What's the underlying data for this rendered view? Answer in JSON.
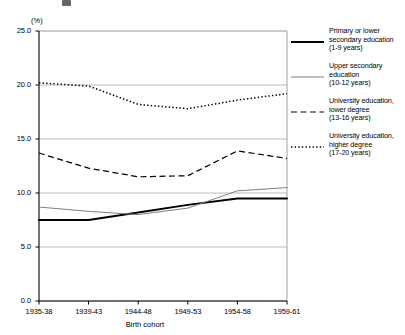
{
  "axes": {
    "unit_label": "(%)",
    "xlabel": "Birth cohort",
    "ylabel": "",
    "yticks": [
      "0.0",
      "5.0",
      "10.0",
      "15.0",
      "20.0",
      "25.0"
    ],
    "xticks": [
      "1935-38",
      "1939-43",
      "1944-48",
      "1949-53",
      "1954-58",
      "1959-61"
    ]
  },
  "legend": {
    "items": [
      {
        "label": "Primary or lower\nsecondary education\n(1-9 years)",
        "style": "solid-thick",
        "color": "#000000",
        "name": "primary-or-lower-secondary"
      },
      {
        "label": "Upper secondary\neducation\n(10-12 years)",
        "style": "solid-thin",
        "color": "#808080",
        "name": "upper-secondary"
      },
      {
        "label": "University education,\nlower degree\n(13-16 years)",
        "style": "dashed",
        "color": "#000000",
        "name": "university-lower-degree"
      },
      {
        "label": "University education,\nhigher degree\n(17-20 years)",
        "style": "dotted",
        "color": "#000000",
        "name": "university-higher-degree"
      }
    ]
  },
  "chart_data": {
    "type": "line",
    "title": "",
    "xlabel": "Birth cohort",
    "ylabel": "(%)",
    "ylim": [
      0.0,
      25.0
    ],
    "ytick_step": 5.0,
    "grid": true,
    "legend_position": "right",
    "categories": [
      "1935-38",
      "1939-43",
      "1944-48",
      "1949-53",
      "1954-58",
      "1959-61"
    ],
    "series": [
      {
        "name": "Primary or lower secondary education (1-9 years)",
        "style": "solid-thick",
        "color": "#000000",
        "values": [
          7.5,
          7.5,
          8.2,
          8.9,
          9.5,
          9.5
        ]
      },
      {
        "name": "Upper secondary education (10-12 years)",
        "style": "solid-thin",
        "color": "#808080",
        "values": [
          8.7,
          8.3,
          8.0,
          8.6,
          10.2,
          10.5
        ]
      },
      {
        "name": "University education, lower degree (13-16 years)",
        "style": "dashed",
        "color": "#000000",
        "values": [
          13.7,
          12.3,
          11.5,
          11.6,
          13.9,
          13.2
        ]
      },
      {
        "name": "University education, higher degree (17-20 years)",
        "style": "dotted",
        "color": "#000000",
        "values": [
          20.2,
          19.9,
          18.2,
          17.8,
          18.6,
          19.2
        ]
      }
    ]
  }
}
